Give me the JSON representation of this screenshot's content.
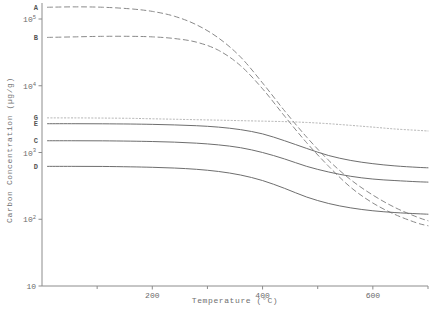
{
  "chart_data": {
    "type": "line",
    "title": "",
    "xlabel": "Temperature  (°C)",
    "ylabel": "Carbon Concentration  (µg/g)",
    "xlim": [
      0,
      700
    ],
    "ylim": [
      10,
      200000
    ],
    "yscale": "log",
    "xscale": "linear",
    "grid": false,
    "legend": "curve-end-labels-left",
    "x_ticks": [
      200,
      400,
      600
    ],
    "x_tick_labels": [
      "200",
      "400",
      "600"
    ],
    "x_minor_ticks": [
      100,
      300,
      500,
      700
    ],
    "y_ticks": [
      10,
      100,
      1000,
      10000,
      100000
    ],
    "y_tick_labels": [
      "10",
      "10²",
      "10³",
      "10⁴",
      "10⁵"
    ],
    "y_tick_mantissa": [
      "10",
      "10",
      "10",
      "10",
      "10"
    ],
    "y_tick_exponents": [
      "",
      "2",
      "3",
      "4",
      "5"
    ],
    "series": [
      {
        "name": "A",
        "label": "A",
        "style": "dashed",
        "color": "#8a8a8a",
        "x": [
          10,
          60,
          110,
          160,
          200,
          240,
          280,
          320,
          360,
          400,
          440,
          480,
          520,
          560,
          600,
          640,
          680,
          700
        ],
        "y": [
          150000,
          152000,
          150000,
          142000,
          130000,
          110000,
          82000,
          52000,
          27000,
          11000,
          4200,
          1700,
          760,
          390,
          230,
          150,
          108,
          95
        ]
      },
      {
        "name": "B",
        "label": "B",
        "style": "dashed",
        "color": "#8a8a8a",
        "x": [
          10,
          60,
          110,
          160,
          200,
          240,
          280,
          320,
          360,
          400,
          440,
          480,
          520,
          560,
          600,
          640,
          680,
          700
        ],
        "y": [
          53000,
          54000,
          55000,
          55000,
          54000,
          51000,
          45000,
          34000,
          20000,
          9000,
          3500,
          1400,
          620,
          300,
          175,
          118,
          88,
          80
        ]
      },
      {
        "name": "G",
        "label": "G",
        "style": "dotted",
        "color": "#a8a8a8",
        "x": [
          10,
          60,
          110,
          160,
          200,
          240,
          280,
          320,
          360,
          400,
          440,
          480,
          520,
          560,
          600,
          640,
          680,
          700
        ],
        "y": [
          3300,
          3300,
          3280,
          3250,
          3200,
          3150,
          3100,
          3050,
          3000,
          2950,
          2900,
          2820,
          2700,
          2550,
          2400,
          2250,
          2150,
          2100
        ]
      },
      {
        "name": "E",
        "label": "E",
        "style": "solid",
        "color": "#6e6e6e",
        "x": [
          10,
          60,
          110,
          160,
          200,
          240,
          280,
          320,
          360,
          400,
          440,
          480,
          520,
          560,
          600,
          640,
          680,
          700
        ],
        "y": [
          2700,
          2700,
          2690,
          2670,
          2640,
          2590,
          2520,
          2400,
          2200,
          1900,
          1500,
          1150,
          900,
          760,
          680,
          630,
          600,
          590
        ]
      },
      {
        "name": "C",
        "label": "C",
        "style": "solid",
        "color": "#6e6e6e",
        "x": [
          10,
          60,
          110,
          160,
          200,
          240,
          280,
          320,
          360,
          400,
          440,
          480,
          520,
          560,
          600,
          640,
          680,
          700
        ],
        "y": [
          1500,
          1500,
          1495,
          1480,
          1460,
          1430,
          1380,
          1300,
          1180,
          1000,
          800,
          620,
          510,
          440,
          400,
          380,
          365,
          360
        ]
      },
      {
        "name": "D",
        "label": "D",
        "style": "solid",
        "color": "#6e6e6e",
        "x": [
          10,
          60,
          110,
          160,
          200,
          240,
          280,
          320,
          360,
          400,
          440,
          480,
          520,
          560,
          600,
          640,
          680,
          700
        ],
        "y": [
          620,
          620,
          618,
          610,
          600,
          585,
          560,
          520,
          460,
          380,
          290,
          215,
          172,
          148,
          134,
          126,
          121,
          119
        ]
      }
    ]
  }
}
